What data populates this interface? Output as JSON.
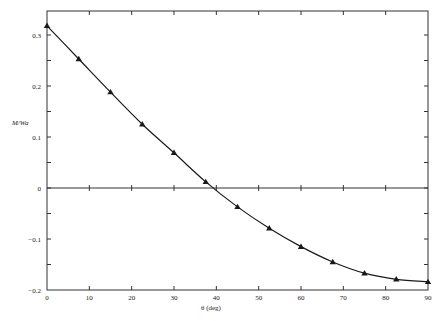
{
  "chart_data": {
    "type": "line",
    "title": "",
    "xlabel": "θ (deg)",
    "ylabel": "M/Wa",
    "xlim": [
      0,
      90
    ],
    "ylim": [
      -0.2,
      0.33
    ],
    "x_ticks": [
      0,
      10,
      20,
      30,
      40,
      50,
      60,
      70,
      80,
      90
    ],
    "x_tick_labels": [
      "0",
      "10",
      "20",
      "30",
      "40",
      "50",
      "60",
      "70",
      "80",
      "90"
    ],
    "y_ticks": [
      -0.2,
      -0.1,
      0,
      0.1,
      0.2,
      0.3
    ],
    "y_tick_labels": [
      "−0.2",
      "−0.1",
      "0",
      "0.1",
      "0.2",
      "0.3"
    ],
    "y_minor_ticks": [
      -0.15,
      -0.05,
      0.05,
      0.15,
      0.25
    ],
    "grid": false,
    "zero_line": true,
    "legend": null,
    "series": [
      {
        "name": "M/Wa",
        "marker": "triangle",
        "x": [
          0,
          7.5,
          15,
          22.5,
          30,
          37.5,
          45,
          52.5,
          60,
          67.5,
          75,
          82.5,
          90
        ],
        "values": [
          0.318,
          0.253,
          0.188,
          0.125,
          0.069,
          0.012,
          -0.037,
          -0.079,
          -0.115,
          -0.145,
          -0.167,
          -0.179,
          -0.184
        ]
      }
    ]
  },
  "colors": {
    "line": "#1a1a1a",
    "axis": "#333333",
    "background": "#ffffff"
  }
}
